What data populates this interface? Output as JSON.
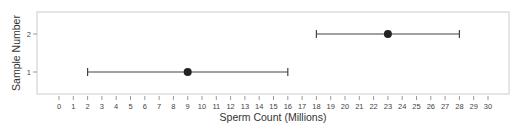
{
  "chart_data": {
    "type": "scatter",
    "subtype": "errorbar",
    "title": "",
    "xlabel": "Sperm Count (Millions)",
    "ylabel": "Sample Number",
    "xlim": [
      -1.5,
      31.5
    ],
    "ylim": [
      0.45,
      2.6
    ],
    "x_ticks": [
      0,
      1,
      2,
      3,
      4,
      5,
      6,
      7,
      8,
      9,
      10,
      11,
      12,
      13,
      14,
      15,
      16,
      17,
      18,
      19,
      20,
      21,
      22,
      23,
      24,
      25,
      26,
      27,
      28,
      29,
      30
    ],
    "y_ticks": [
      1,
      2
    ],
    "grid": false,
    "legend": null,
    "points": [
      {
        "sample": 1,
        "mean": 9,
        "lower": 2,
        "upper": 16
      },
      {
        "sample": 2,
        "mean": 23,
        "lower": 18,
        "upper": 28
      }
    ],
    "colors": {
      "frame": "#cccccc",
      "line": "#444444",
      "marker": "#222222",
      "text": "#333333"
    }
  }
}
